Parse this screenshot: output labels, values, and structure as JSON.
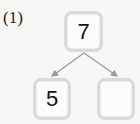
{
  "problem": {
    "label": "(1)",
    "top_value": "7",
    "left_value": "5",
    "right_value": ""
  },
  "colors": {
    "background": "#f7f7f5",
    "box_border": "#d9d9d9",
    "arrow": "#999999",
    "text": "#111111"
  }
}
